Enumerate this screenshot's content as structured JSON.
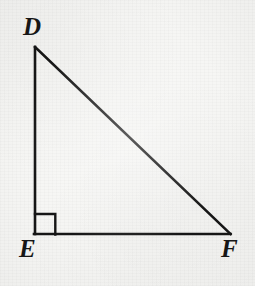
{
  "figure": {
    "name": "right-triangle-DEF",
    "background_color": "#f6f6f4",
    "stroke_color": "#161616",
    "stroke_width": 2.6,
    "canvas": {
      "width": 255,
      "height": 286
    }
  },
  "vertices": {
    "D": {
      "label": "D",
      "x": 35,
      "y": 47,
      "label_x": 23,
      "label_y": 14,
      "position": "top-left-apex"
    },
    "E": {
      "label": "E",
      "x": 35,
      "y": 234,
      "label_x": 19,
      "label_y": 236,
      "position": "bottom-left"
    },
    "F": {
      "label": "F",
      "x": 230,
      "y": 234,
      "label_x": 221,
      "label_y": 236,
      "position": "bottom-right"
    }
  },
  "sides": [
    {
      "name": "DE",
      "from": "D",
      "to": "E",
      "type": "vertical-leg",
      "x1": 35,
      "y1": 47,
      "x2": 35,
      "y2": 234
    },
    {
      "name": "EF",
      "from": "E",
      "to": "F",
      "type": "horizontal-leg",
      "x1": 35,
      "y1": 234,
      "x2": 230,
      "y2": 234
    },
    {
      "name": "DF",
      "from": "D",
      "to": "F",
      "type": "hypotenuse",
      "x1": 35,
      "y1": 47,
      "x2": 230,
      "y2": 234
    }
  ],
  "right_angle_marker": {
    "name": "right-angle-square",
    "at_vertex": "E",
    "size": 20,
    "x": 35,
    "y": 214,
    "path": "M 35 214 L 55 214 L 55 234"
  }
}
